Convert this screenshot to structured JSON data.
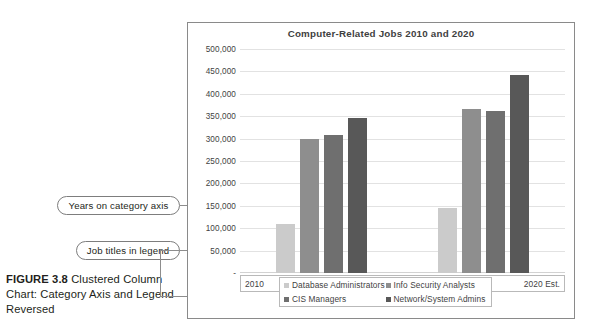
{
  "caption": {
    "figure_number": "FIGURE 3.8",
    "text": " Clustered Column Chart: Category Axis and Legend Reversed"
  },
  "callouts": [
    {
      "id": "years",
      "label": "Years on category axis"
    },
    {
      "id": "legend",
      "label": "Job titles in legend"
    }
  ],
  "chart_data": {
    "type": "bar",
    "title": "Computer-Related Jobs 2010 and 2020",
    "xlabel": "",
    "ylabel": "",
    "categories": [
      "2010",
      "2020 Est."
    ],
    "series": [
      {
        "name": "Database Administrators",
        "values": [
          110000,
          145000
        ],
        "color": "#cbcbcb"
      },
      {
        "name": "Info Security Analysts",
        "values": [
          300000,
          367000
        ],
        "color": "#8e8e8e"
      },
      {
        "name": "CIS Managers",
        "values": [
          308000,
          362000
        ],
        "color": "#6f6f6f"
      },
      {
        "name": "Network/System Admins",
        "values": [
          347000,
          443000
        ],
        "color": "#585858"
      }
    ],
    "ylim": [
      0,
      500000
    ],
    "ytick_values": [
      0,
      50000,
      100000,
      150000,
      200000,
      250000,
      300000,
      350000,
      400000,
      450000,
      500000
    ],
    "ytick_labels": [
      "-",
      "50,000",
      "100,000",
      "150,000",
      "200,000",
      "250,000",
      "300,000",
      "350,000",
      "400,000",
      "450,000",
      "500,000"
    ],
    "grid": true,
    "legend_position": "bottom",
    "legend_order": [
      "Database Administrators",
      "Info Security Analysts",
      "CIS Managers",
      "Network/System Admins"
    ]
  }
}
